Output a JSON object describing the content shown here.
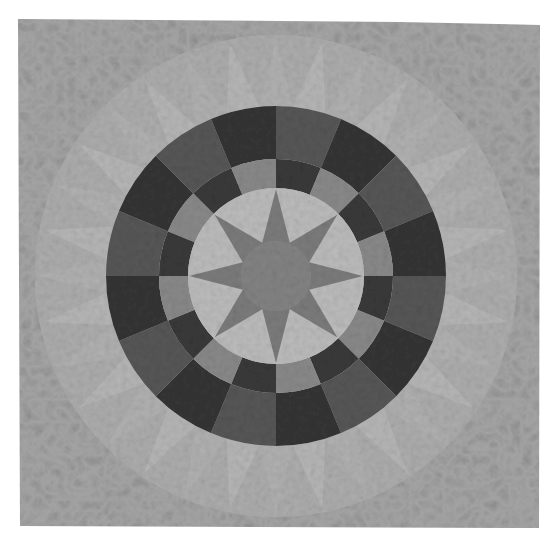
{
  "image": {
    "kind": "photograph",
    "subject": "Mariner's compass style circular quilt",
    "description": "Square grayscale quilt with an eight-pointed star at the center, surrounded by a light ring, a 16-segment inner ring of alternating patterned and dark fabric, a 16-segment outer ring of alternating dark and medium fabric, and a faint sunburst of light fan wedges on a mottled background.",
    "canvas": {
      "width": 552,
      "height": 546,
      "background": "#ffffff"
    },
    "quilt": {
      "x": 18,
      "y": 19,
      "width": 522,
      "height": 509
    },
    "center": {
      "x": 276,
      "y": 276
    },
    "colors": {
      "background_fabric": "#a3a3a3",
      "background_speckle": "#8f8f8f",
      "fan_light": "#b6b6b6",
      "fan_mid": "#adadad",
      "outer_ring_dark": "#353535",
      "outer_ring_medium": "#575757",
      "inner_ring_patterned": "#8a8a8a",
      "inner_ring_dark": "#3a3a3a",
      "light_circle": "#bcbcbc",
      "star": "#7c7c7c",
      "star_center": "#838383",
      "seam": "#2a2a2a"
    },
    "rings": {
      "fan_radius": 241,
      "fan_count": 32,
      "outer_ring_radius": 170,
      "outer_ring_segments": 16,
      "inner_ring_radius": 117,
      "inner_ring_segments": 16,
      "light_circle_radius": 88,
      "star_points": 8,
      "star_inner_radius": 30,
      "star_center_radius": 35
    }
  }
}
